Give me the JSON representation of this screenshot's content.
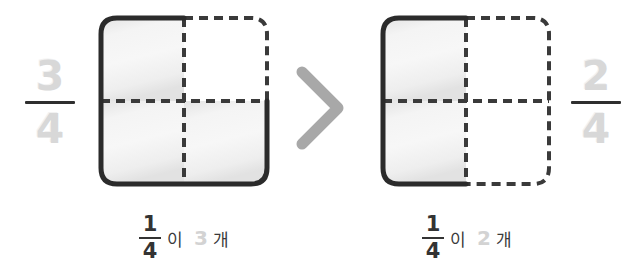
{
  "diagram": {
    "type": "fraction-comparison",
    "topic": "comparing fractions with the same denominator",
    "background_color": "#ffffff",
    "comparison_symbol": ">",
    "comparison_icon": "greater-than-chevron-icon",
    "comparison_color": "#a8a8a8"
  },
  "left": {
    "fraction": {
      "numerator": "3",
      "denominator": "4",
      "text_color": "#d8d8d8",
      "bar_color": "#2f2f2f"
    },
    "model": {
      "total_parts": 4,
      "shaded_parts": 3,
      "rows": 2,
      "cols": 2,
      "shaded_cells": [
        {
          "row": 0,
          "col": 0
        },
        {
          "row": 1,
          "col": 0
        },
        {
          "row": 1,
          "col": 1
        }
      ],
      "fill_color": "#eeeeee",
      "solid_outline_color": "#2b2b2b",
      "dashed_outline_color": "#3a3a3a"
    },
    "caption": {
      "unit_numerator": "1",
      "unit_denominator": "4",
      "particle": "이",
      "count": "3",
      "counter": "개",
      "count_color": "#d3d3d3"
    }
  },
  "right": {
    "fraction": {
      "numerator": "2",
      "denominator": "4",
      "text_color": "#d8d8d8",
      "bar_color": "#2f2f2f"
    },
    "model": {
      "total_parts": 4,
      "shaded_parts": 2,
      "rows": 2,
      "cols": 2,
      "shaded_cells": [
        {
          "row": 0,
          "col": 0
        },
        {
          "row": 1,
          "col": 0
        }
      ],
      "fill_color": "#eeeeee",
      "solid_outline_color": "#2b2b2b",
      "dashed_outline_color": "#3a3a3a"
    },
    "caption": {
      "unit_numerator": "1",
      "unit_denominator": "4",
      "particle": "이",
      "count": "2",
      "counter": "개",
      "count_color": "#d3d3d3"
    }
  }
}
